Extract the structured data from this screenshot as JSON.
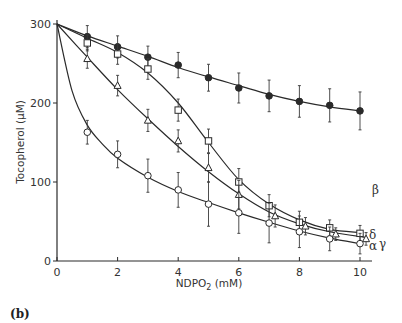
{
  "chart_data": {
    "type": "line",
    "title": "",
    "panel_label": "(b)",
    "xlabel": "NDPO",
    "xlabel_sub": "2",
    "xlabel_unit": " (mM)",
    "ylabel": "Tocopherol (μM)",
    "xlim": [
      0,
      10
    ],
    "ylim": [
      0,
      300
    ],
    "xticks": [
      0,
      2,
      4,
      6,
      8,
      10
    ],
    "yticks": [
      0,
      100,
      200,
      300
    ],
    "grid": false,
    "legend": "inline labels at right end of curves",
    "series": [
      {
        "name": "β",
        "marker": "filled-circle",
        "x": [
          1,
          2,
          3,
          4,
          5,
          6,
          7,
          8,
          9,
          10
        ],
        "y": [
          284,
          271,
          258,
          248,
          232,
          219,
          209,
          202,
          197,
          190
        ],
        "err": [
          14,
          14,
          14,
          16,
          17,
          19,
          20,
          20,
          21,
          24
        ],
        "curve": [
          [
            0,
            300
          ],
          [
            1,
            285
          ],
          [
            2,
            272
          ],
          [
            3,
            259
          ],
          [
            4,
            245
          ],
          [
            5,
            233
          ],
          [
            6,
            222
          ],
          [
            7,
            211
          ],
          [
            8,
            202
          ],
          [
            9,
            195
          ],
          [
            10,
            190
          ]
        ]
      },
      {
        "name": "δ",
        "marker": "open-square",
        "x": [
          1,
          2,
          3,
          4,
          5,
          6,
          7,
          8,
          9,
          10
        ],
        "y": [
          276,
          262,
          243,
          191,
          152,
          100,
          70,
          49,
          42,
          35
        ],
        "err": [
          10,
          13,
          13,
          14,
          15,
          17,
          14,
          14,
          10,
          10
        ],
        "curve": [
          [
            0,
            300
          ],
          [
            1,
            282
          ],
          [
            2,
            264
          ],
          [
            3,
            238
          ],
          [
            4,
            200
          ],
          [
            5,
            150
          ],
          [
            6,
            103
          ],
          [
            7,
            72
          ],
          [
            8,
            52
          ],
          [
            9,
            40
          ],
          [
            10,
            36
          ]
        ]
      },
      {
        "name": "γ",
        "marker": "open-triangle",
        "x": [
          1,
          2,
          3,
          4,
          5,
          6,
          7.2,
          8.2,
          9.2,
          10.2
        ],
        "y": [
          256,
          222,
          178,
          152,
          118,
          84,
          57,
          44,
          34,
          28
        ],
        "err": [
          12,
          13,
          14,
          14,
          18,
          18,
          14,
          11,
          8,
          8
        ],
        "curve": [
          [
            0,
            300
          ],
          [
            1,
            258
          ],
          [
            2,
            217
          ],
          [
            3,
            180
          ],
          [
            4,
            145
          ],
          [
            5,
            113
          ],
          [
            6,
            85
          ],
          [
            7,
            62
          ],
          [
            8,
            47
          ],
          [
            9,
            37
          ],
          [
            10.2,
            30
          ]
        ]
      },
      {
        "name": "α",
        "marker": "open-circle",
        "x": [
          1,
          2,
          3,
          4,
          5,
          6,
          7,
          8,
          9,
          10
        ],
        "y": [
          163,
          135,
          108,
          90,
          72,
          61,
          48,
          37,
          28,
          22
        ],
        "err": [
          15,
          17,
          21,
          22,
          28,
          26,
          25,
          20,
          15,
          13
        ],
        "curve": [
          [
            0,
            300
          ],
          [
            0.5,
            215
          ],
          [
            1,
            172
          ],
          [
            1.5,
            148
          ],
          [
            2,
            130
          ],
          [
            3,
            106
          ],
          [
            4,
            88
          ],
          [
            5,
            74
          ],
          [
            6,
            61
          ],
          [
            7,
            49
          ],
          [
            8,
            38
          ],
          [
            9,
            29
          ],
          [
            10,
            22
          ]
        ]
      }
    ]
  }
}
